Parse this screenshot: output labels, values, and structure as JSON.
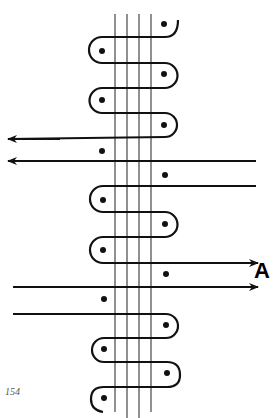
{
  "diagram": {
    "label": "A",
    "page_number": "154",
    "colors": {
      "ink": "#111111",
      "background": "#ffffff",
      "page_number": "#555555"
    },
    "warp_threads": {
      "count": 4,
      "x": [
        115,
        127,
        139,
        151
      ],
      "y_top": 14,
      "y_bottom": 414
    },
    "weft_path_rows_y": [
      37,
      63,
      88,
      113,
      137,
      186,
      212,
      237,
      263,
      314,
      338,
      362,
      387
    ],
    "arrows_left": [
      {
        "y": 139,
        "direction": "left"
      },
      {
        "y": 161,
        "direction": "left"
      }
    ],
    "arrows_right": [
      {
        "y": 263,
        "direction": "right"
      },
      {
        "y": 287,
        "direction": "right"
      }
    ],
    "dots": [
      [
        164,
        24
      ],
      [
        102,
        51
      ],
      [
        164,
        74
      ],
      [
        102,
        100
      ],
      [
        164,
        125
      ],
      [
        102,
        151
      ],
      [
        165,
        175
      ],
      [
        103,
        200
      ],
      [
        165,
        224
      ],
      [
        103,
        250
      ],
      [
        166,
        274
      ],
      [
        104,
        299
      ],
      [
        166,
        325
      ],
      [
        104,
        349
      ],
      [
        167,
        373
      ],
      [
        104,
        398
      ]
    ]
  }
}
